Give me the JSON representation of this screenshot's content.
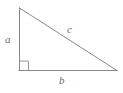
{
  "figure": {
    "name": "right-triangle-diagram",
    "background_color": "#ffffff",
    "stroke_color": "#8a8a8a",
    "label_color": "#6e6e6e",
    "stroke_width": 1,
    "vertices": {
      "apex": {
        "x": 19,
        "y": 8
      },
      "right_angle": {
        "x": 19,
        "y": 70
      },
      "bottom_right": {
        "x": 117,
        "y": 70
      }
    },
    "sides": [
      {
        "name": "vertical-leg",
        "label": "a",
        "from": "apex",
        "to": "right_angle"
      },
      {
        "name": "horizontal-leg",
        "label": "b",
        "from": "right_angle",
        "to": "bottom_right"
      },
      {
        "name": "hypotenuse",
        "label": "c",
        "from": "apex",
        "to": "bottom_right"
      }
    ],
    "right_angle_marker": {
      "x": 19,
      "y": 61,
      "size": 9
    },
    "labels": {
      "leg_a": "a",
      "leg_b": "b",
      "hypotenuse_c": "c"
    }
  }
}
